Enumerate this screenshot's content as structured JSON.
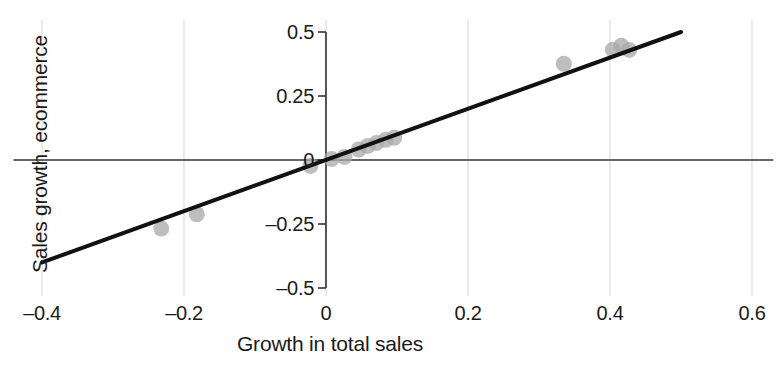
{
  "chart_data": {
    "type": "scatter",
    "title": "",
    "xlabel": "Growth in total sales",
    "ylabel": "Sales growth, ecommerce",
    "xlim": [
      -0.44,
      0.63
    ],
    "ylim": [
      -0.54,
      0.545
    ],
    "xticks": [
      -0.4,
      -0.2,
      0,
      0.2,
      0.4,
      0.6
    ],
    "xticklabels": [
      "–0.4",
      "–0.2",
      "0",
      "0.2",
      "0.4",
      "0.6"
    ],
    "yticks": [
      0.5,
      0.25,
      0,
      -0.25,
      -0.5
    ],
    "yticklabels": [
      "0.5",
      "0.25",
      "0",
      "–0.25",
      "–0.5"
    ],
    "grid": "vertical-faint",
    "legend": "none",
    "marker": {
      "shape": "circle",
      "color": "#a8a8a8",
      "opacity": 0.75,
      "radius_px": 8
    },
    "points": [
      {
        "x": -0.232,
        "y": -0.268
      },
      {
        "x": -0.182,
        "y": -0.212
      },
      {
        "x": -0.022,
        "y": -0.023
      },
      {
        "x": 0.008,
        "y": 0.004
      },
      {
        "x": 0.026,
        "y": 0.012
      },
      {
        "x": 0.046,
        "y": 0.041
      },
      {
        "x": 0.059,
        "y": 0.055
      },
      {
        "x": 0.071,
        "y": 0.066
      },
      {
        "x": 0.084,
        "y": 0.079
      },
      {
        "x": 0.096,
        "y": 0.087
      },
      {
        "x": 0.335,
        "y": 0.376
      },
      {
        "x": 0.404,
        "y": 0.431
      },
      {
        "x": 0.416,
        "y": 0.446
      },
      {
        "x": 0.427,
        "y": 0.43
      }
    ],
    "trendline": {
      "type": "linear",
      "slope": 1.0,
      "intercept": 0.0,
      "x_start": -0.4,
      "x_end": 0.5,
      "y_start": -0.4,
      "y_end": 0.5,
      "color": "#111111",
      "width_px": 4
    },
    "axis_lines": {
      "horizontal_at_y": 0,
      "vertical_at_x": 0,
      "color": "#333333"
    }
  }
}
